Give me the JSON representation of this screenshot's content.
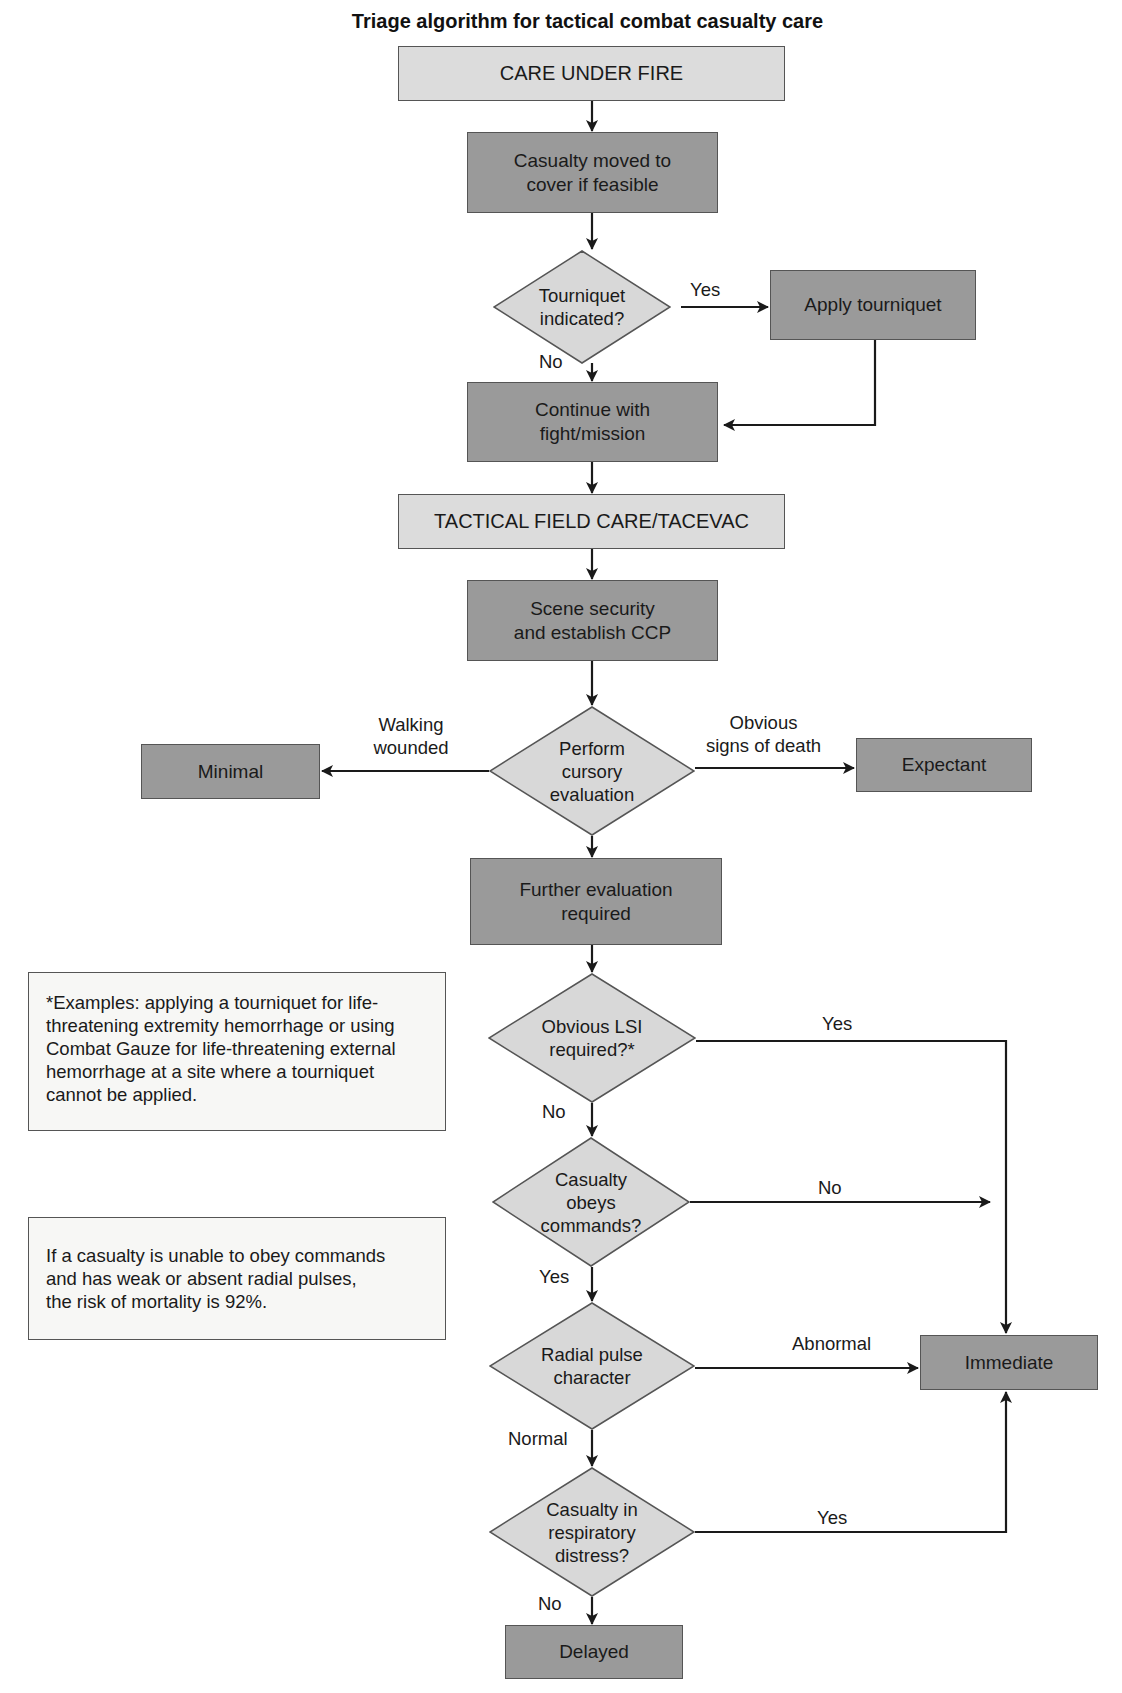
{
  "title": "Triage algorithm for tactical combat casualty care",
  "colors": {
    "phase_fill": "#dcdcdc",
    "step_fill": "#9a9a9a",
    "decision_fill": "#d8d8d8",
    "note_fill": "#f7f7f5",
    "line": "#1a1a1a"
  },
  "nodes": {
    "care_under_fire": "CARE UNDER FIRE",
    "casualty_moved": "Casualty moved to\ncover if feasible",
    "tourniquet_indicated": "Tourniquet\nindicated?",
    "apply_tourniquet": "Apply tourniquet",
    "continue_fight": "Continue with\nfight/mission",
    "tactical_field_care": "TACTICAL FIELD CARE/TACEVAC",
    "scene_security": "Scene security\nand establish CCP",
    "cursory_evaluation": "Perform\ncursory\nevaluation",
    "minimal": "Minimal",
    "expectant": "Expectant",
    "further_evaluation": "Further evaluation\nrequired",
    "lsi_required": "Obvious LSI\nrequired?*",
    "obeys_commands": "Casualty\nobeys\ncommands?",
    "radial_pulse": "Radial pulse\ncharacter",
    "respiratory_distress": "Casualty in\nrespiratory\ndistress?",
    "immediate": "Immediate",
    "delayed": "Delayed"
  },
  "edge_labels": {
    "tourniquet_yes": "Yes",
    "tourniquet_no": "No",
    "walking_wounded": "Walking\nwounded",
    "signs_of_death": "Obvious\nsigns of death",
    "lsi_yes": "Yes",
    "lsi_no": "No",
    "obeys_no": "No",
    "obeys_yes": "Yes",
    "pulse_abnormal": "Abnormal",
    "pulse_normal": "Normal",
    "resp_yes": "Yes",
    "resp_no": "No"
  },
  "notes": {
    "lsi_examples": "*Examples: applying a tourniquet for life-\nthreatening extremity hemorrhage or using\nCombat Gauze for life-threatening external\nhemorrhage at a site where a tourniquet\ncannot be applied.",
    "mortality": "If a casualty is unable to obey commands\nand has weak or absent radial pulses,\nthe risk of mortality is 92%."
  }
}
